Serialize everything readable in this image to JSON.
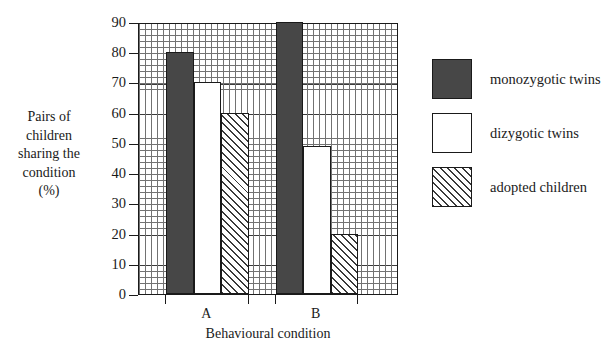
{
  "chart_data": {
    "type": "bar",
    "title": "",
    "categories": [
      "A",
      "B"
    ],
    "series": [
      {
        "name": "monozygotic twins",
        "values": [
          80,
          90
        ],
        "fill": "solid"
      },
      {
        "name": "dizygotic twins",
        "values": [
          70,
          49
        ],
        "fill": "open"
      },
      {
        "name": "adopted children",
        "values": [
          60,
          20
        ],
        "fill": "hatch"
      }
    ],
    "xlabel": "Behavioural condition",
    "ylabel": "Pairs of children sharing the condition (%)",
    "ylim": [
      0,
      90
    ],
    "yticks": [
      0,
      10,
      20,
      30,
      40,
      50,
      60,
      70,
      80,
      90
    ],
    "ytick_labels": [
      "0",
      "10",
      "20",
      "30",
      "40",
      "50",
      "60",
      "70",
      "80",
      "90"
    ],
    "grid": true,
    "grid_style": "graph-paper minor and major",
    "legend_position": "right",
    "colors": {
      "solid": "#474747",
      "open": "#ffffff",
      "hatch_line": "#3a3a3a",
      "axis": "#1a1a1a",
      "grid_minor": "#5a5a5a",
      "grid_major": "#1a1a1a",
      "background": "#ffffff"
    }
  },
  "axis": {
    "y_title_lines": [
      "Pairs of",
      "children",
      "sharing the",
      "condition",
      "(%)"
    ],
    "x_title": "Behavioural condition"
  },
  "legend": {
    "items": [
      {
        "label": "monozygotic twins"
      },
      {
        "label": "dizygotic twins"
      },
      {
        "label": "adopted children"
      }
    ]
  }
}
